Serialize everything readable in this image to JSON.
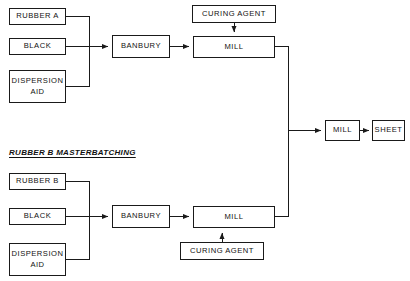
{
  "diagram": {
    "background_color": "#ffffff",
    "line_color": "#1a1a1a",
    "text_color": "#111111",
    "sections": [
      {
        "id": "section-rubber-b",
        "label": "RUBBER B MASTERBATCHING"
      }
    ],
    "nodes": [
      {
        "id": "rubber-a",
        "label": "RUBBER A"
      },
      {
        "id": "black-top",
        "label": "BLACK"
      },
      {
        "id": "dispersion-aid-top",
        "label": "DISPERSION\nAID"
      },
      {
        "id": "banbury-top",
        "label": "BANBURY"
      },
      {
        "id": "curing-agent-top",
        "label": "CURING AGENT"
      },
      {
        "id": "mill-top",
        "label": "MILL"
      },
      {
        "id": "rubber-b",
        "label": "RUBBER B"
      },
      {
        "id": "black-bottom",
        "label": "BLACK"
      },
      {
        "id": "dispersion-aid-bottom",
        "label": "DISPERSION\nAID"
      },
      {
        "id": "banbury-bottom",
        "label": "BANBURY"
      },
      {
        "id": "mill-bottom",
        "label": "MILL"
      },
      {
        "id": "curing-agent-bottom",
        "label": "CURING AGENT"
      },
      {
        "id": "mill-final",
        "label": "MILL"
      },
      {
        "id": "sheet",
        "label": "SHEET"
      }
    ]
  }
}
